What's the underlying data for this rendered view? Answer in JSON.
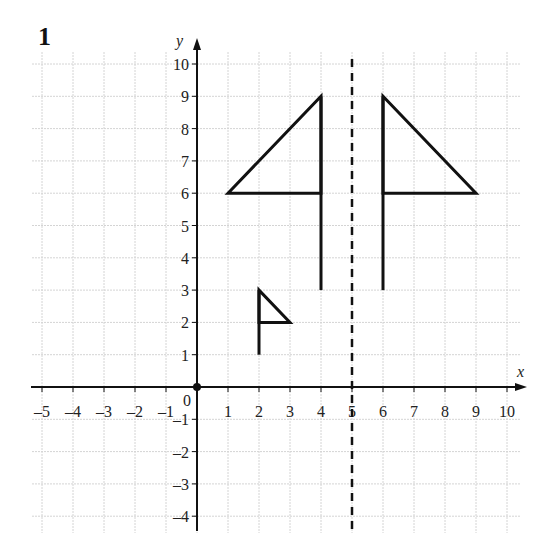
{
  "question_number": "1",
  "chart_data": {
    "type": "line",
    "title": "",
    "xlabel": "x",
    "ylabel": "y",
    "xlim": [
      -5,
      10
    ],
    "ylim": [
      -4,
      10
    ],
    "grid": true,
    "x_ticks": [
      -5,
      -4,
      -3,
      -2,
      -1,
      1,
      2,
      3,
      4,
      5,
      6,
      7,
      8,
      9,
      10
    ],
    "y_ticks": [
      -4,
      -3,
      -2,
      -1,
      1,
      2,
      3,
      4,
      5,
      6,
      7,
      8,
      9,
      10
    ],
    "origin_label": "0",
    "mirror_line": {
      "x": 5,
      "style": "dashed",
      "label": "x = 5"
    },
    "shapes": [
      {
        "name": "flag-left",
        "pole": [
          [
            4,
            3
          ],
          [
            4,
            9
          ]
        ],
        "triangle": [
          [
            1,
            6
          ],
          [
            4,
            9
          ],
          [
            4,
            6
          ]
        ]
      },
      {
        "name": "flag-right-reflection",
        "pole": [
          [
            6,
            3
          ],
          [
            6,
            9
          ]
        ],
        "triangle": [
          [
            6,
            9
          ],
          [
            9,
            6
          ],
          [
            6,
            6
          ]
        ]
      },
      {
        "name": "flag-small",
        "pole": [
          [
            2,
            1
          ],
          [
            2,
            3
          ]
        ],
        "triangle": [
          [
            2,
            3
          ],
          [
            3,
            2
          ],
          [
            2,
            2
          ]
        ]
      }
    ],
    "points": [
      {
        "name": "origin",
        "x": 0,
        "y": 0
      }
    ]
  },
  "style": {
    "line_color": "#111111",
    "grid_color": "#d4d4d4",
    "tick_label_color": "#333333"
  }
}
